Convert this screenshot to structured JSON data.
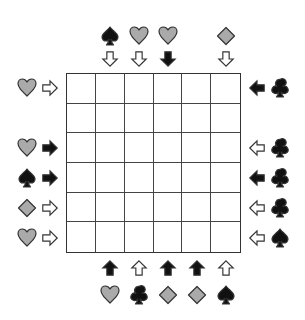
{
  "puzzle": {
    "grid_size": {
      "rows": 6,
      "cols": 6
    },
    "colors": {
      "filled": "#111111",
      "light": "#aaaaaa",
      "outline": "#333333",
      "hollow": "#ffffff"
    },
    "top": [
      {
        "col": 1,
        "suit": "spade",
        "suit_style": "filled",
        "arrow": "down",
        "arrow_style": "hollow"
      },
      {
        "col": 2,
        "suit": "heart",
        "suit_style": "light",
        "arrow": "down",
        "arrow_style": "hollow"
      },
      {
        "col": 3,
        "suit": "heart",
        "suit_style": "light",
        "arrow": "down",
        "arrow_style": "filled"
      },
      {
        "col": 5,
        "suit": "diamond",
        "suit_style": "light",
        "arrow": "down",
        "arrow_style": "hollow"
      }
    ],
    "bottom": [
      {
        "col": 1,
        "suit": "heart",
        "suit_style": "light",
        "arrow": "up",
        "arrow_style": "filled"
      },
      {
        "col": 2,
        "suit": "club",
        "suit_style": "filled",
        "arrow": "up",
        "arrow_style": "hollow"
      },
      {
        "col": 3,
        "suit": "diamond",
        "suit_style": "light",
        "arrow": "up",
        "arrow_style": "filled"
      },
      {
        "col": 4,
        "suit": "diamond",
        "suit_style": "light",
        "arrow": "up",
        "arrow_style": "filled"
      },
      {
        "col": 5,
        "suit": "spade",
        "suit_style": "filled",
        "arrow": "up",
        "arrow_style": "hollow"
      }
    ],
    "left": [
      {
        "row": 0,
        "suit": "heart",
        "suit_style": "light",
        "arrow": "right",
        "arrow_style": "hollow"
      },
      {
        "row": 2,
        "suit": "heart",
        "suit_style": "light",
        "arrow": "right",
        "arrow_style": "filled"
      },
      {
        "row": 3,
        "suit": "spade",
        "suit_style": "filled",
        "arrow": "right",
        "arrow_style": "filled"
      },
      {
        "row": 4,
        "suit": "diamond",
        "suit_style": "light",
        "arrow": "right",
        "arrow_style": "hollow"
      },
      {
        "row": 5,
        "suit": "heart",
        "suit_style": "light",
        "arrow": "right",
        "arrow_style": "hollow"
      }
    ],
    "right": [
      {
        "row": 0,
        "suit": "club",
        "suit_style": "filled",
        "arrow": "left",
        "arrow_style": "filled"
      },
      {
        "row": 2,
        "suit": "club",
        "suit_style": "filled",
        "arrow": "left",
        "arrow_style": "hollow"
      },
      {
        "row": 3,
        "suit": "club",
        "suit_style": "filled",
        "arrow": "left",
        "arrow_style": "filled"
      },
      {
        "row": 4,
        "suit": "club",
        "suit_style": "filled",
        "arrow": "left",
        "arrow_style": "hollow"
      },
      {
        "row": 5,
        "suit": "spade",
        "suit_style": "filled",
        "arrow": "left",
        "arrow_style": "hollow"
      }
    ]
  }
}
